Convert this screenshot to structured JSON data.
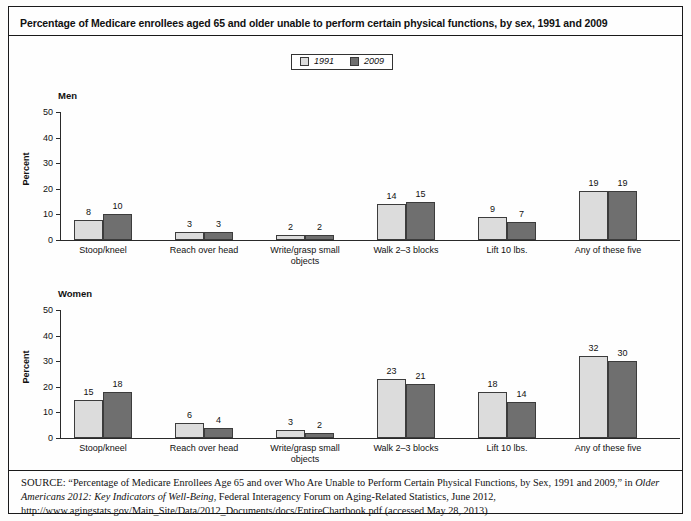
{
  "title": "Percentage of Medicare enrollees aged 65 and older unable to perform certain physical functions, by sex, 1991 and 2009",
  "legend": {
    "entries": [
      {
        "label": "1991",
        "color": "#dcdcdc"
      },
      {
        "label": "2009",
        "color": "#6f6f6f"
      }
    ]
  },
  "source": {
    "prefix": "SOURCE:",
    "line1_a": " “Percentage of Medicare Enrollees Age 65 and over Who Are Unable to Perform Certain Physical Functions, by Sex, 1991 and 2009,” in ",
    "italic1": "Older Americans 2012: Key Indicators of Well-Being",
    "line1_b": ", Federal Interagency Forum on Aging-Related Statistics, June 2012, http://www.agingstats.gov/Main_Site/Data/2012_Documents/docs/EntireChartbook.pdf (accessed May 28, 2013)"
  },
  "chart_data": {
    "type": "bar",
    "title": "Percentage of Medicare enrollees aged 65 and older unable to perform certain physical functions, by sex, 1991 and 2009",
    "xlabel": "",
    "ylabel": "Percent",
    "ylim": [
      0,
      50
    ],
    "yticks": [
      0,
      10,
      20,
      30,
      40,
      50
    ],
    "grid": false,
    "legend_position": "top-center",
    "categories": [
      "Stoop/kneel",
      "Reach over head",
      "Write/grasp small objects",
      "Walk 2–3 blocks",
      "Lift 10 lbs.",
      "Any of these five"
    ],
    "panels": [
      {
        "name": "Men",
        "series": [
          {
            "name": "1991",
            "values": [
              8,
              3,
              2,
              14,
              9,
              19
            ]
          },
          {
            "name": "2009",
            "values": [
              10,
              3,
              2,
              15,
              7,
              19
            ]
          }
        ]
      },
      {
        "name": "Women",
        "series": [
          {
            "name": "1991",
            "values": [
              15,
              6,
              3,
              23,
              18,
              32
            ]
          },
          {
            "name": "2009",
            "values": [
              18,
              4,
              2,
              21,
              14,
              30
            ]
          }
        ]
      }
    ]
  }
}
